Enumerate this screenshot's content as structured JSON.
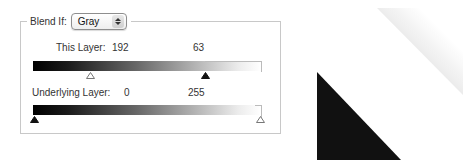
{
  "blend_if": {
    "label": "Blend If:",
    "selected": "Gray",
    "this_layer": {
      "label": "This Layer:",
      "black_value": "192",
      "white_value": "63"
    },
    "underlying_layer": {
      "label": "Underlying Layer:",
      "black_value": "0",
      "white_value": "255"
    }
  },
  "icons": {
    "select_stepper": "up-down-stepper-icon",
    "slider_white": "white-slider-handle-icon",
    "slider_black": "black-slider-handle-icon"
  },
  "colors": {
    "black_shape": "#111111",
    "gray_shape_start": "#c8c8c8",
    "gray_shape_end": "#ffffff",
    "panel_border": "#c8c8c8"
  }
}
